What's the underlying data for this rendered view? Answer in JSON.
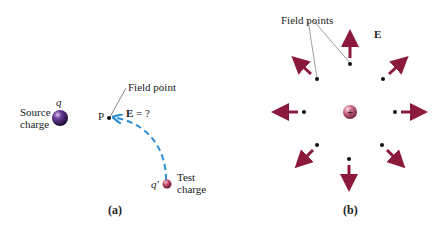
{
  "panel_a": {
    "source_charge": {
      "symbol": "q",
      "label_line1": "Source",
      "label_line2": "charge"
    },
    "field_point": {
      "point_label": "P",
      "callout": "Field point",
      "field_query_symbol": "E",
      "field_query_rest": " = ?"
    },
    "test_charge": {
      "symbol": "q′",
      "label_line1": "Test",
      "label_line2": "charge"
    },
    "caption": "(a)"
  },
  "panel_b": {
    "callout": "Field points",
    "field_symbol": "E",
    "center_charge_sign": "+",
    "caption": "(b)"
  },
  "colors": {
    "source_charge": "#3a1f5e",
    "test_charge": "#b8475f",
    "center_charge": "#c05c7a",
    "path_dashed": "#2f8fd6",
    "arrow": "#8b1a3a",
    "text": "#222222"
  }
}
